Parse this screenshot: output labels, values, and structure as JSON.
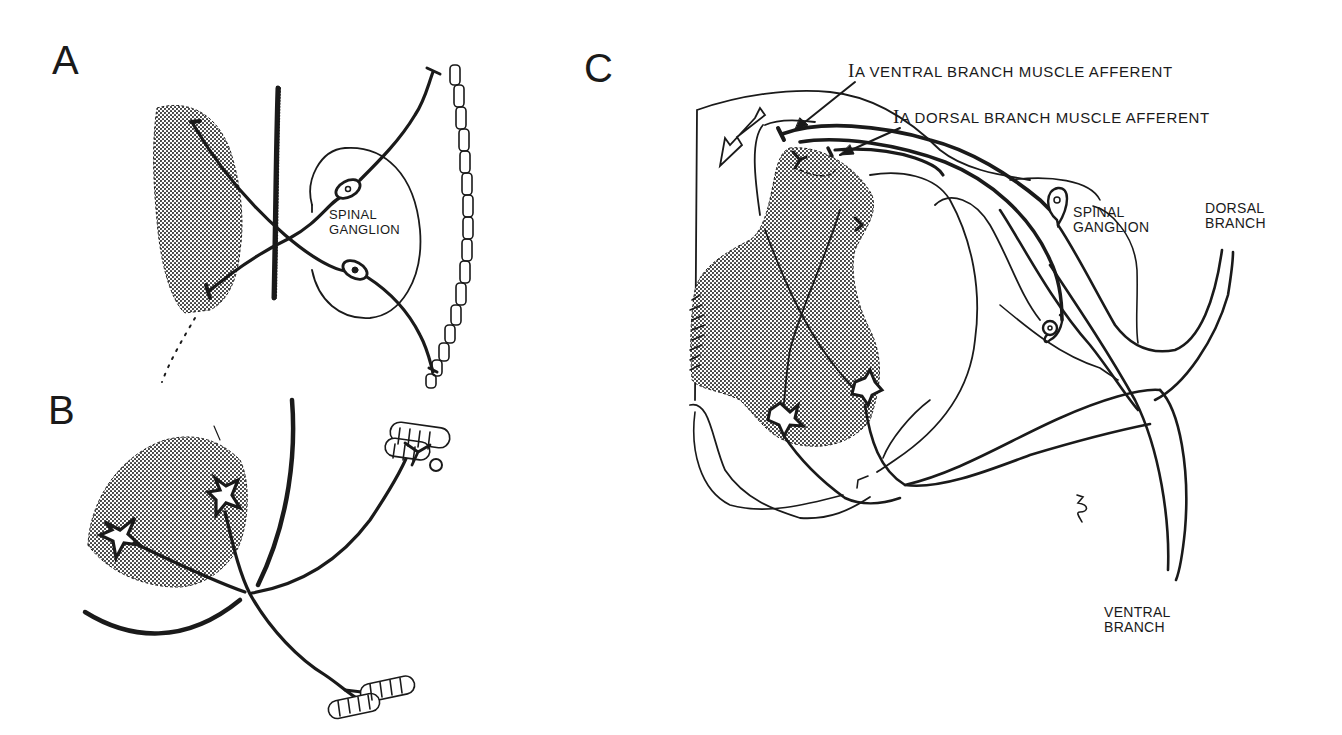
{
  "figure": {
    "panels": [
      {
        "id": "A",
        "letter": "A",
        "labels": {
          "ganglion_line1": "SPINAL",
          "ganglion_line2": "GANGLION"
        }
      },
      {
        "id": "B",
        "letter": "B",
        "labels": {}
      },
      {
        "id": "C",
        "letter": "C",
        "labels": {
          "ventral_afferent_prefix": "I",
          "ventral_afferent": "A VENTRAL BRANCH  MUSCLE AFFERENT",
          "dorsal_afferent_prefix": "I",
          "dorsal_afferent": "A DORSAL BRANCH  MUSCLE AFFERENT",
          "ganglion_line1": "SPINAL",
          "ganglion_line2": "GANGLION",
          "dorsal_branch_line1": "DORSAL",
          "dorsal_branch_line2": "BRANCH",
          "ventral_branch_line1": "VENTRAL",
          "ventral_branch_line2": "BRANCH"
        }
      }
    ],
    "colors": {
      "ink": "#1a1a1a",
      "stipple": "#8a8a8a",
      "background": "#ffffff"
    }
  }
}
